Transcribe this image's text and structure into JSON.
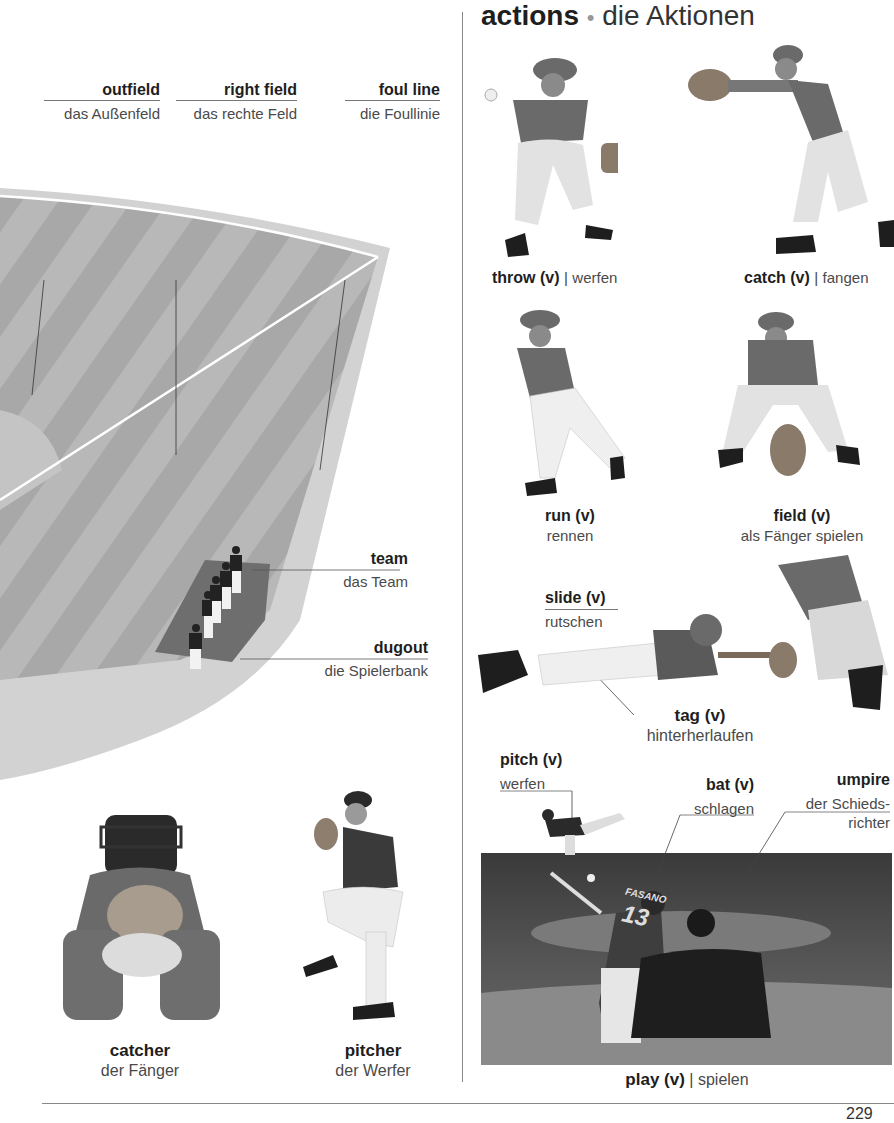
{
  "left_panel": {
    "field_labels": [
      {
        "term": "outfield",
        "translation": "das Außenfeld"
      },
      {
        "term": "right field",
        "translation": "das rechte Feld"
      },
      {
        "term": "foul line",
        "translation": "die Foullinie"
      },
      {
        "term": "team",
        "translation": "das Team"
      },
      {
        "term": "dugout",
        "translation": "die Spielerbank"
      }
    ],
    "players": [
      {
        "term": "catcher",
        "translation": "der Fänger"
      },
      {
        "term": "pitcher",
        "translation": "der Werfer"
      }
    ]
  },
  "right_panel": {
    "heading": {
      "english": "actions",
      "bullet": "•",
      "german": "die Aktionen"
    },
    "actions": [
      {
        "term": "throw (v)",
        "separator": "|",
        "translation": "werfen"
      },
      {
        "term": "catch (v)",
        "separator": "|",
        "translation": "fangen"
      },
      {
        "term": "run (v)",
        "translation": "rennen"
      },
      {
        "term": "field (v)",
        "translation": "als Fänger spielen"
      },
      {
        "term": "slide (v)",
        "translation": "rutschen"
      },
      {
        "term": "tag (v)",
        "translation": "hinterherlaufen"
      },
      {
        "term": "pitch (v)",
        "translation": "werfen"
      },
      {
        "term": "bat (v)",
        "translation": "schlagen"
      },
      {
        "term": "umpire",
        "translation_line1": "der Schieds-",
        "translation_line2": "richter"
      },
      {
        "term": "play (v)",
        "separator": "|",
        "translation": "spielen"
      }
    ],
    "photo_text": {
      "jersey_name": "FASANO",
      "jersey_number": "13"
    }
  },
  "footer": {
    "page_number": "229"
  }
}
